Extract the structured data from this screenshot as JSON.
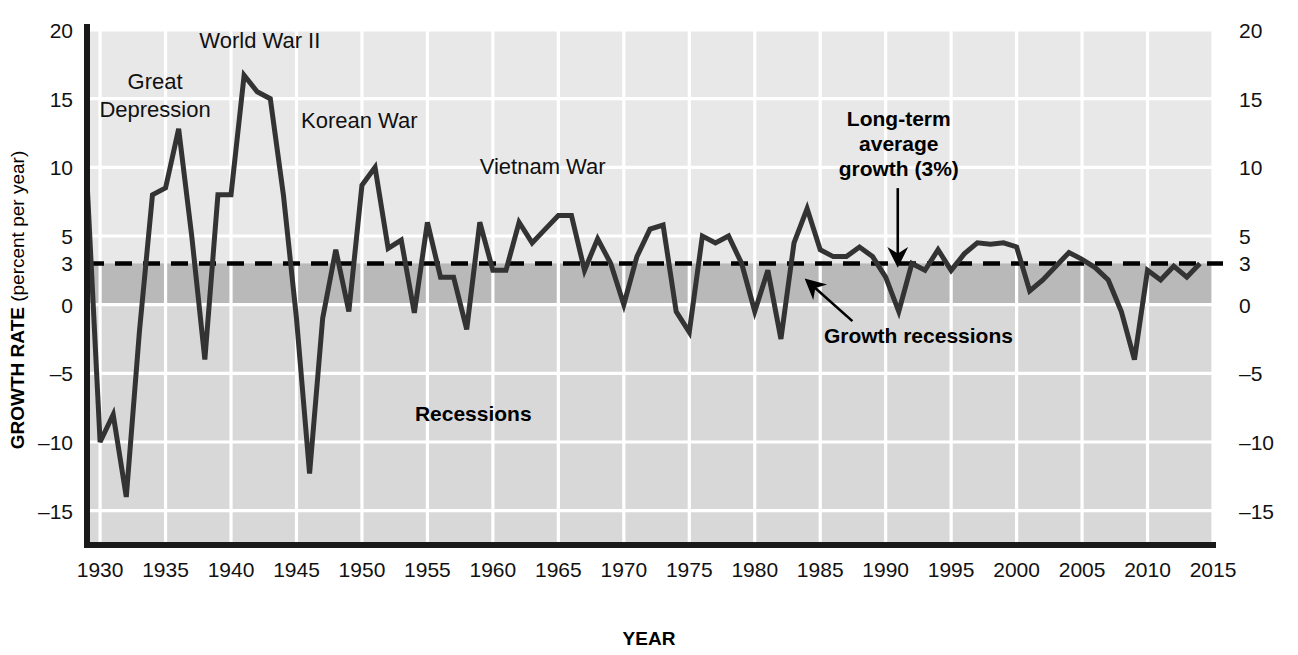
{
  "chart_data": {
    "type": "line",
    "title": "",
    "xlabel": "YEAR",
    "ylabel_bold": "GROWTH RATE",
    "ylabel_sub": " (percent per year)",
    "xlim": [
      1929,
      2015
    ],
    "ylim": [
      -17.5,
      20
    ],
    "grid": true,
    "legend_position": "none",
    "xticks": [
      "1930",
      "1935",
      "1940",
      "1945",
      "1950",
      "1955",
      "1960",
      "1965",
      "1970",
      "1975",
      "1980",
      "1985",
      "1990",
      "1995",
      "2000",
      "2005",
      "2010",
      "2015"
    ],
    "xtick_values": [
      1930,
      1935,
      1940,
      1945,
      1950,
      1955,
      1960,
      1965,
      1970,
      1975,
      1980,
      1985,
      1990,
      1995,
      2000,
      2005,
      2010,
      2015
    ],
    "yticks_left": [
      "20",
      "15",
      "10",
      "5",
      "3",
      "0",
      "-5",
      "-10",
      "-15"
    ],
    "yticks_right": [
      "20",
      "15",
      "10",
      "5",
      "3",
      "0",
      "-5",
      "-10",
      "-15"
    ],
    "ytick_values": [
      20,
      15,
      10,
      5,
      3,
      0,
      -5,
      -10,
      -15
    ],
    "reference_line": {
      "value": 3,
      "label": "Long-term average growth (3%)",
      "style": "dashed"
    },
    "bands": [
      {
        "name": "growth-recession-band",
        "from": 0,
        "to": 3,
        "color": "#b9b9b9"
      },
      {
        "name": "recession-band",
        "from": -17.5,
        "to": 0,
        "color": "#d8d8d8"
      }
    ],
    "series": [
      {
        "name": "US real GDP growth rate",
        "color": "#333333",
        "x": [
          1929,
          1930,
          1931,
          1932,
          1933,
          1934,
          1935,
          1936,
          1937,
          1938,
          1939,
          1940,
          1941,
          1942,
          1943,
          1944,
          1945,
          1946,
          1947,
          1948,
          1949,
          1950,
          1951,
          1952,
          1953,
          1954,
          1955,
          1956,
          1957,
          1958,
          1959,
          1960,
          1961,
          1962,
          1963,
          1964,
          1965,
          1966,
          1967,
          1968,
          1969,
          1970,
          1971,
          1972,
          1973,
          1974,
          1975,
          1976,
          1977,
          1978,
          1979,
          1980,
          1981,
          1982,
          1983,
          1984,
          1985,
          1986,
          1987,
          1988,
          1989,
          1990,
          1991,
          1992,
          1993,
          1994,
          1995,
          1996,
          1997,
          1998,
          1999,
          2000,
          2001,
          2002,
          2003,
          2004,
          2005,
          2006,
          2007,
          2008,
          2009,
          2010,
          2011,
          2012,
          2013,
          2014
        ],
        "values": [
          9.0,
          -10.0,
          -8.0,
          -14.0,
          -2.0,
          8.0,
          8.5,
          12.8,
          5.0,
          -4.0,
          8.0,
          8.0,
          16.7,
          15.5,
          15.0,
          8.0,
          -1.0,
          -12.3,
          -1.0,
          4.0,
          -0.5,
          8.7,
          10.0,
          4.1,
          4.7,
          -0.6,
          6.0,
          2.0,
          2.0,
          -1.8,
          6.0,
          2.5,
          2.5,
          6.0,
          4.5,
          5.5,
          6.5,
          6.5,
          2.5,
          4.8,
          3.0,
          0.0,
          3.5,
          5.5,
          5.8,
          -0.5,
          -2.0,
          5.0,
          4.5,
          5.0,
          3.0,
          -0.5,
          2.5,
          -2.5,
          4.5,
          7.0,
          4.0,
          3.5,
          3.5,
          4.2,
          3.5,
          2.0,
          -0.5,
          3.0,
          2.5,
          4.0,
          2.5,
          3.7,
          4.5,
          4.4,
          4.5,
          4.2,
          1.0,
          1.8,
          2.8,
          3.8,
          3.3,
          2.7,
          1.8,
          -0.5,
          -4.0,
          2.5,
          1.8,
          2.8,
          2.0,
          3.0
        ],
        "linewidth": 5
      }
    ],
    "annotations": [
      {
        "name": "great-depression",
        "text_lines": [
          "Great",
          "Depression"
        ],
        "x": 1934.2,
        "y": 15.7,
        "bold": false,
        "arrow": false
      },
      {
        "name": "world-war-ii",
        "text_lines": [
          "World War II"
        ],
        "x": 1942.2,
        "y": 18.7,
        "bold": false,
        "arrow": false
      },
      {
        "name": "korean-war",
        "text_lines": [
          "Korean War"
        ],
        "x": 1949.8,
        "y": 12.9,
        "bold": false,
        "arrow": false
      },
      {
        "name": "vietnam-war",
        "text_lines": [
          "Vietnam War"
        ],
        "x": 1963.8,
        "y": 9.5,
        "bold": false,
        "arrow": false
      },
      {
        "name": "long-term-average-growth",
        "text_lines": [
          "Long-term",
          "average",
          "growth (3%)"
        ],
        "x": 1991.0,
        "y": 13.0,
        "bold": true,
        "arrow": true,
        "arrow_direction": "down"
      },
      {
        "name": "growth-recessions",
        "text_lines": [
          "Growth recessions"
        ],
        "x": 1992.5,
        "y": -2.8,
        "bold": true,
        "arrow": true,
        "arrow_direction": "up-left"
      },
      {
        "name": "recessions",
        "text_lines": [
          "Recessions"
        ],
        "x": 1958.5,
        "y": -8.5,
        "bold": true,
        "arrow": false
      }
    ]
  },
  "colors": {
    "plot_background": "#e8e8e8",
    "band_growth_recession": "#b9b9b9",
    "band_recession": "#d8d8d8",
    "gridline": "#ffffff",
    "line": "#333333",
    "axis": "#1a1a1a",
    "text": "#111111"
  }
}
